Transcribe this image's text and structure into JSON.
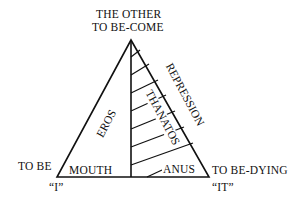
{
  "apex": {
    "line1": "THE OTHER",
    "line2": "TO BE-COME"
  },
  "left_vertex": {
    "label": "TO BE",
    "quote": "“I”"
  },
  "right_vertex": {
    "label": "TO BE-DYING",
    "quote": "“IT”"
  },
  "regions": {
    "left": {
      "name": "EROS",
      "base": "MOUTH"
    },
    "right": {
      "name": "THANATOS",
      "base": "ANUS",
      "edge": "REPRESSION"
    }
  }
}
